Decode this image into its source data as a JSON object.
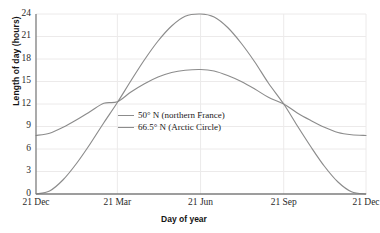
{
  "chart_data": {
    "type": "line",
    "title": "",
    "xlabel": "Day of year",
    "ylabel": "Length of day (hours)",
    "xticklabels": [
      "21 Dec",
      "21 Mar",
      "21 Jun",
      "21 Sep",
      "21 Dec"
    ],
    "xtickpositions": [
      0,
      90,
      182,
      274,
      365
    ],
    "yticklabels": [
      "0",
      "3",
      "6",
      "9",
      "12",
      "15",
      "18",
      "21",
      "24"
    ],
    "ytickvalues": [
      0,
      3,
      6,
      9,
      12,
      15,
      18,
      21,
      24
    ],
    "xlim": [
      0,
      365
    ],
    "ylim": [
      0,
      24
    ],
    "grid": true,
    "grid_color": "#eceaea",
    "legend_position": "center",
    "axis_color": "#7d7d7d",
    "series": [
      {
        "name": "50° N (northern France)",
        "color": "#8c8c8c",
        "x": [
          0,
          15,
          30,
          45,
          60,
          75,
          90,
          105,
          120,
          135,
          150,
          165,
          182,
          197,
          212,
          227,
          242,
          257,
          274,
          289,
          304,
          319,
          334,
          349,
          365
        ],
        "values": [
          7.8,
          8.1,
          8.9,
          9.9,
          11.0,
          12.1,
          12.3,
          13.6,
          14.7,
          15.6,
          16.2,
          16.5,
          16.6,
          16.4,
          15.8,
          15.0,
          14.0,
          12.9,
          12.0,
          10.8,
          9.8,
          8.9,
          8.2,
          7.9,
          7.8
        ]
      },
      {
        "name": "66.5° N (Arctic Circle)",
        "color": "#8c8c8c",
        "x": [
          0,
          15,
          30,
          45,
          60,
          75,
          90,
          105,
          120,
          135,
          150,
          165,
          182,
          197,
          212,
          227,
          242,
          257,
          274,
          289,
          304,
          319,
          334,
          349,
          365
        ],
        "values": [
          0.0,
          0.4,
          1.9,
          4.1,
          6.7,
          9.5,
          12.2,
          15.1,
          17.9,
          20.4,
          22.4,
          23.7,
          24.0,
          23.6,
          22.2,
          20.1,
          17.6,
          14.8,
          12.0,
          9.1,
          6.3,
          3.7,
          1.6,
          0.3,
          0.0
        ]
      }
    ]
  },
  "legend": {
    "items": [
      {
        "label": "50° N (northern France)"
      },
      {
        "label": "66.5° N (Arctic Circle)"
      }
    ]
  }
}
